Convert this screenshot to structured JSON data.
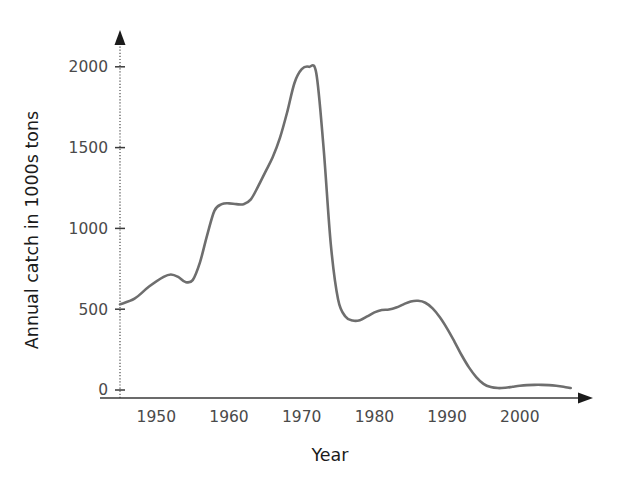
{
  "chart_data": {
    "type": "line",
    "title": "",
    "subtitle": "",
    "xlabel": "Year",
    "ylabel": "Annual catch in 1000s tons",
    "xlim": [
      1945,
      2008
    ],
    "ylim": [
      0,
      2080
    ],
    "xticks": [
      1950,
      1960,
      1970,
      1980,
      1990,
      2000
    ],
    "xtick_labels": [
      "1950",
      "1960",
      "1970",
      "1980",
      "1990",
      "2000"
    ],
    "yticks": [
      0,
      500,
      1000,
      1500,
      2000
    ],
    "ytick_labels": [
      "0",
      "500",
      "1000",
      "1500",
      "2000"
    ],
    "grid": false,
    "legend": null,
    "legend_position": "none",
    "annotations": [],
    "series": [
      {
        "name": "Annual catch",
        "color": "#6e6e6e",
        "x": [
          1945,
          1947,
          1949,
          1951,
          1952,
          1953,
          1954,
          1955,
          1956,
          1957,
          1958,
          1959,
          1960,
          1961,
          1962,
          1963,
          1964,
          1965,
          1966,
          1967,
          1968,
          1969,
          1970,
          1971,
          1972,
          1973,
          1974,
          1975,
          1976,
          1977,
          1978,
          1979,
          1980,
          1981,
          1982,
          1983,
          1984,
          1985,
          1986,
          1987,
          1988,
          1989,
          1990,
          1991,
          1992,
          1993,
          1994,
          1995,
          1996,
          1997,
          1998,
          1999,
          2000,
          2001,
          2002,
          2003,
          2004,
          2005,
          2006,
          2007
        ],
        "values": [
          530,
          565,
          640,
          700,
          715,
          700,
          668,
          680,
          790,
          960,
          1110,
          1150,
          1155,
          1150,
          1150,
          1180,
          1260,
          1350,
          1440,
          1560,
          1720,
          1900,
          1985,
          2000,
          1960,
          1500,
          900,
          560,
          455,
          430,
          432,
          455,
          480,
          495,
          498,
          510,
          530,
          548,
          552,
          540,
          505,
          450,
          380,
          300,
          215,
          140,
          80,
          38,
          18,
          12,
          14,
          20,
          26,
          30,
          32,
          32,
          30,
          26,
          20,
          12
        ]
      }
    ]
  },
  "axes": {
    "y_arrow": "up-arrow-icon",
    "x_arrow": "right-arrow-icon"
  }
}
